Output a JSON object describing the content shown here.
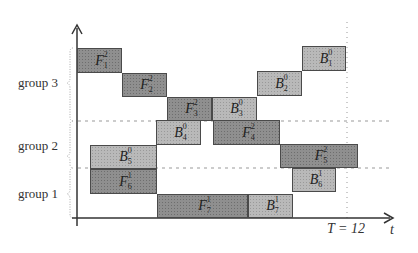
{
  "diagram": {
    "type": "pipeline-schedule",
    "x_axis_label": "t",
    "end_marker_label": "T = 12",
    "groups": [
      {
        "label": "group 3"
      },
      {
        "label": "group 2"
      },
      {
        "label": "group 1"
      }
    ],
    "colors": {
      "forward_fill": "#8f8f8f",
      "backward_fill": "#b9b9b9",
      "axis": "#333333",
      "dashed": "#999999"
    },
    "blocks": [
      {
        "kind": "F",
        "base": "F",
        "sub": "1",
        "sup": "2",
        "x": 77,
        "y": 48,
        "w": 45,
        "h": 25
      },
      {
        "kind": "F",
        "base": "F",
        "sub": "2",
        "sup": "2",
        "x": 122,
        "y": 73,
        "w": 45,
        "h": 24
      },
      {
        "kind": "F",
        "base": "F",
        "sub": "3",
        "sup": "2",
        "x": 167,
        "y": 97,
        "w": 45,
        "h": 24
      },
      {
        "kind": "B",
        "base": "B",
        "sub": "3",
        "sup": "0",
        "x": 212,
        "y": 97,
        "w": 45,
        "h": 24
      },
      {
        "kind": "B",
        "base": "B",
        "sub": "2",
        "sup": "0",
        "x": 257,
        "y": 71,
        "w": 45,
        "h": 25
      },
      {
        "kind": "B",
        "base": "B",
        "sub": "1",
        "sup": "0",
        "x": 302,
        "y": 46,
        "w": 44,
        "h": 25
      },
      {
        "kind": "B",
        "base": "B",
        "sub": "4",
        "sup": "0",
        "x": 156,
        "y": 120,
        "w": 45,
        "h": 25
      },
      {
        "kind": "F",
        "base": "F",
        "sub": "4",
        "sup": "2",
        "x": 213,
        "y": 120,
        "w": 67,
        "h": 25
      },
      {
        "kind": "B",
        "base": "B",
        "sub": "5",
        "sup": "0",
        "x": 90,
        "y": 145,
        "w": 67,
        "h": 24
      },
      {
        "kind": "F",
        "base": "F",
        "sub": "6",
        "sup": "1",
        "x": 90,
        "y": 169,
        "w": 67,
        "h": 25
      },
      {
        "kind": "F",
        "base": "F",
        "sub": "5",
        "sup": "2",
        "x": 280,
        "y": 144,
        "w": 78,
        "h": 24
      },
      {
        "kind": "B",
        "base": "B",
        "sub": "6",
        "sup": "1",
        "x": 292,
        "y": 168,
        "w": 44,
        "h": 24
      },
      {
        "kind": "F",
        "base": "F",
        "sub": "7",
        "sup": "1",
        "x": 157,
        "y": 194,
        "w": 91,
        "h": 24
      },
      {
        "kind": "B",
        "base": "B",
        "sub": "7",
        "sup": "1",
        "x": 248,
        "y": 194,
        "w": 45,
        "h": 24
      }
    ]
  }
}
